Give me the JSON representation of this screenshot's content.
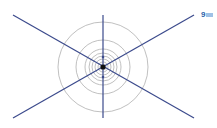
{
  "diagram": {
    "center": [
      103,
      67
    ],
    "line_color": "#3b4a8c",
    "circle_color": "#b0b0b0",
    "lines": [
      {
        "x1": 13,
        "y1": 15,
        "x2": 194,
        "y2": 118
      },
      {
        "x1": 13,
        "y1": 118,
        "x2": 194,
        "y2": 15
      },
      {
        "x1": 103,
        "y1": 15,
        "x2": 103,
        "y2": 118
      }
    ],
    "circle_radii": [
      45,
      27,
      18,
      14,
      11,
      8,
      5,
      3
    ]
  },
  "badge": {
    "label": "9",
    "color": "#2a5fa8"
  }
}
